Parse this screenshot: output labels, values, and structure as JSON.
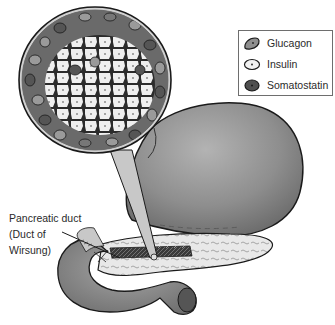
{
  "figure": {
    "colors": {
      "background": "#ffffff",
      "outline": "#1a1a1a",
      "organ_fill": "#8a8a8a",
      "pancreas_fill": "#e6e6e6",
      "insulin_cell": "#efefef",
      "glucagon_cell": "#9a9a9a",
      "somatostatin_cell": "#555555",
      "magnifier_cone": "#c8c8c8"
    }
  },
  "legend": {
    "items": [
      {
        "label": "Glucagon",
        "icon": "glucagon-cell-icon",
        "fill": "#8f8f8f"
      },
      {
        "label": "Insulin",
        "icon": "insulin-cell-icon",
        "fill": "#f2f2f2"
      },
      {
        "label": "Somatostatin",
        "icon": "somatostatin-cell-icon",
        "fill": "#4f4f4f"
      }
    ]
  },
  "callouts": {
    "pancreatic_duct": {
      "lines": [
        "Pancreatic duct",
        "(Duct of",
        "Wirsung)"
      ]
    }
  }
}
